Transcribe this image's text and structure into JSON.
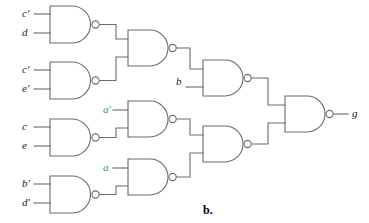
{
  "figure": {
    "caption": "b.",
    "stroke_color": "#6b6b6b",
    "label_color": "#1a1a1a",
    "accent_color": "#2e8b92",
    "background": "#ffffff",
    "type": "logic-gate-schematic",
    "gate_type": "NAND"
  },
  "inputs": [
    {
      "id": "in-1",
      "label": "c′",
      "x": 22,
      "y": 14,
      "wire_y": 14,
      "wire_x2": 50
    },
    {
      "id": "in-2",
      "label": "d",
      "x": 22,
      "y": 33,
      "wire_y": 33,
      "wire_x2": 50
    },
    {
      "id": "in-3",
      "label": "c′",
      "x": 22,
      "y": 70,
      "wire_y": 70,
      "wire_x2": 50
    },
    {
      "id": "in-4",
      "label": "e′",
      "x": 22,
      "y": 89,
      "wire_y": 89,
      "wire_x2": 50
    },
    {
      "id": "in-5",
      "label": "c",
      "x": 22,
      "y": 127,
      "wire_y": 127,
      "wire_x2": 50
    },
    {
      "id": "in-6",
      "label": "e",
      "x": 22,
      "y": 146,
      "wire_y": 146,
      "wire_x2": 50
    },
    {
      "id": "in-7",
      "label": "b′",
      "x": 22,
      "y": 184,
      "wire_y": 184,
      "wire_x2": 50
    },
    {
      "id": "in-8",
      "label": "d′",
      "x": 22,
      "y": 203,
      "wire_y": 203,
      "wire_x2": 50
    }
  ],
  "mid_inputs": [
    {
      "id": "mid-a-not",
      "label": "a′",
      "x": 103,
      "y": 110,
      "teal": true
    },
    {
      "id": "mid-a",
      "label": "a",
      "x": 103,
      "y": 168,
      "teal": true
    },
    {
      "id": "mid-b",
      "label": "b",
      "x": 176,
      "y": 82,
      "teal": false
    }
  ],
  "output": {
    "id": "out-g",
    "label": "g",
    "x": 352,
    "y": 114
  },
  "gates": [
    {
      "id": "gate-1",
      "column": 1,
      "x": 50,
      "y": 6,
      "w": 45,
      "h": 37,
      "inputs": [
        "c′",
        "d"
      ]
    },
    {
      "id": "gate-2",
      "column": 1,
      "x": 50,
      "y": 62,
      "w": 45,
      "h": 37,
      "inputs": [
        "c′",
        "e′"
      ]
    },
    {
      "id": "gate-3",
      "column": 1,
      "x": 50,
      "y": 119,
      "w": 45,
      "h": 37,
      "inputs": [
        "c",
        "e"
      ]
    },
    {
      "id": "gate-4",
      "column": 1,
      "x": 50,
      "y": 176,
      "w": 45,
      "h": 37,
      "inputs": [
        "b′",
        "d′"
      ]
    },
    {
      "id": "gate-5",
      "column": 2,
      "x": 128,
      "y": 30,
      "w": 44,
      "h": 36,
      "inputs": [
        "gate-1",
        "gate-2"
      ]
    },
    {
      "id": "gate-6",
      "column": 2,
      "x": 128,
      "y": 101,
      "w": 44,
      "h": 36,
      "inputs": [
        "a′",
        "gate-3"
      ]
    },
    {
      "id": "gate-7",
      "column": 2,
      "x": 128,
      "y": 159,
      "w": 44,
      "h": 36,
      "inputs": [
        "a",
        "gate-4"
      ]
    },
    {
      "id": "gate-8",
      "column": 3,
      "x": 203,
      "y": 60,
      "w": 44,
      "h": 36,
      "inputs": [
        "gate-5",
        "b"
      ]
    },
    {
      "id": "gate-9",
      "column": 3,
      "x": 203,
      "y": 126,
      "w": 44,
      "h": 36,
      "inputs": [
        "gate-6",
        "gate-7"
      ]
    },
    {
      "id": "gate-10",
      "column": 4,
      "x": 285,
      "y": 96,
      "w": 44,
      "h": 36,
      "inputs": [
        "gate-8",
        "gate-9"
      ]
    }
  ]
}
